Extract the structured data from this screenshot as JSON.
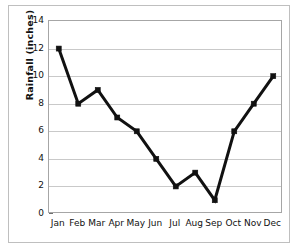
{
  "chart_data": {
    "type": "line",
    "title": "",
    "xlabel": "",
    "ylabel": "Rainfall (inches)",
    "categories": [
      "Jan",
      "Feb",
      "Mar",
      "Apr",
      "May",
      "Jun",
      "Jul",
      "Aug",
      "Sep",
      "Oct",
      "Nov",
      "Dec"
    ],
    "values": [
      12,
      8,
      9,
      7,
      6,
      4,
      2,
      3,
      1,
      6,
      8,
      10
    ],
    "series": [
      {
        "name": "Rainfall",
        "values": [
          12,
          8,
          9,
          7,
          6,
          4,
          2,
          3,
          1,
          6,
          8,
          10
        ],
        "color": "#111111",
        "marker": "square",
        "line_width": 3
      }
    ],
    "ylim": [
      0,
      14
    ],
    "ytick_labels": [
      "0",
      "2",
      "4",
      "6",
      "8",
      "10",
      "12",
      "14"
    ],
    "ytick_values": [
      0,
      2,
      4,
      6,
      8,
      10,
      12,
      14
    ],
    "grid": "horizontal",
    "grid_color": "#c9c9c9",
    "legend": "none",
    "axis_border_color": "#a6a6a6",
    "frame_color": "#bfbfbf",
    "background": "#ffffff",
    "units": "inches"
  }
}
